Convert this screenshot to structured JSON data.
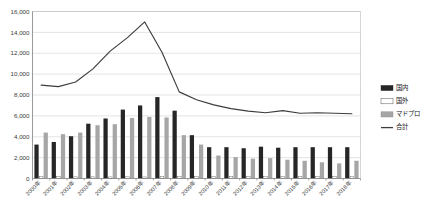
{
  "chart_data": {
    "type": "bar",
    "title": "",
    "subtitle": "",
    "xlabel": "",
    "ylabel": "",
    "ylim": [
      0,
      16000
    ],
    "ytick_step": 2000,
    "ytick_labels": [
      "0",
      "2,000",
      "4,000",
      "6,000",
      "8,000",
      "10,000",
      "12,000",
      "14,000",
      "16,000"
    ],
    "ytick_values": [
      0,
      2000,
      4000,
      6000,
      8000,
      10000,
      12000,
      14000,
      16000
    ],
    "grid": true,
    "legend_position": "right",
    "categories": [
      "2000年",
      "2001年",
      "2002年",
      "2003年",
      "2004年",
      "2005年",
      "2006年",
      "2007年",
      "2008年",
      "2009年",
      "2010年",
      "2011年",
      "2012年",
      "2013年",
      "2014年",
      "2015年",
      "2016年",
      "2017年",
      "2018年"
    ],
    "series": [
      {
        "name": "国内",
        "kind": "bar",
        "color": "#262626",
        "values": [
          3250,
          3500,
          4050,
          5250,
          5750,
          6600,
          7000,
          7800,
          6500,
          4150,
          3000,
          3000,
          2900,
          3050,
          2950,
          3000,
          3000,
          3000,
          3000
        ]
      },
      {
        "name": "国外",
        "kind": "bar",
        "color": "#ffffff",
        "values": [
          180,
          170,
          160,
          160,
          150,
          160,
          150,
          180,
          170,
          180,
          170,
          170,
          170,
          170,
          170,
          170,
          170,
          170,
          180
        ]
      },
      {
        "name": "マドプロ",
        "kind": "bar",
        "color": "#a6a6a6",
        "values": [
          4400,
          4250,
          4400,
          5100,
          5200,
          5800,
          5900,
          5850,
          4150,
          3250,
          2200,
          2050,
          1900,
          1950,
          1800,
          1700,
          1550,
          1450,
          1700
        ]
      },
      {
        "name": "合計",
        "kind": "line",
        "color": "#3c3c3c",
        "values": [
          8950,
          8800,
          9250,
          10500,
          12200,
          13500,
          15000,
          12100,
          8300,
          7550,
          7050,
          6700,
          6450,
          6300,
          6500,
          6250,
          6300,
          6250,
          6200
        ]
      }
    ],
    "legend": [
      {
        "label": "国内",
        "color": "#262626",
        "marker": "square-filled"
      },
      {
        "label": "国外",
        "color": "#ffffff",
        "marker": "square-outline"
      },
      {
        "label": "マドプロ",
        "color": "#a6a6a6",
        "marker": "square-gray"
      },
      {
        "label": "合計",
        "color": "#3c3c3c",
        "marker": "line"
      }
    ]
  }
}
